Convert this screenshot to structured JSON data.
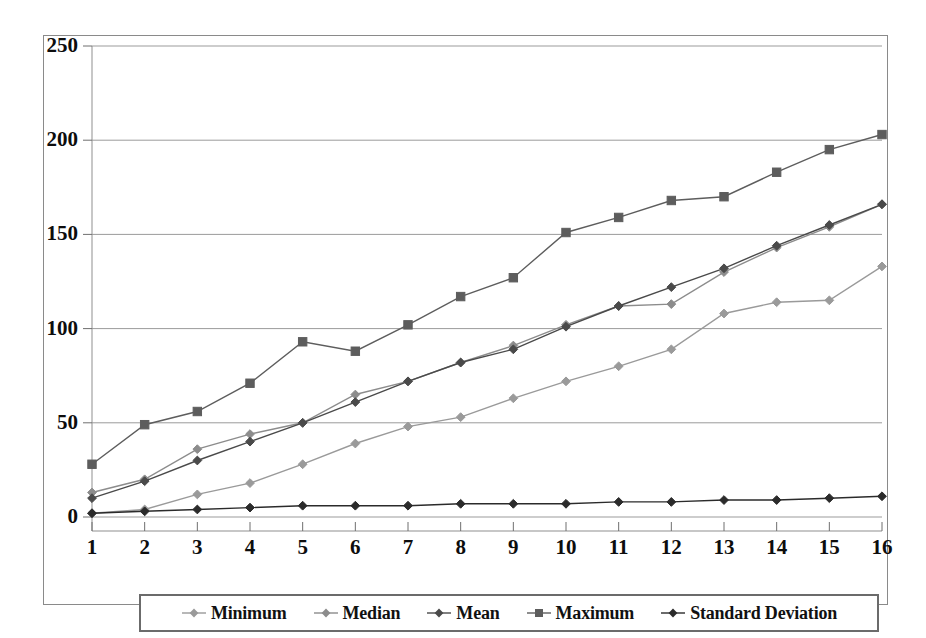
{
  "chart_data": {
    "type": "line",
    "title": "",
    "xlabel": "",
    "ylabel": "",
    "x": [
      1,
      2,
      3,
      4,
      5,
      6,
      7,
      8,
      9,
      10,
      11,
      12,
      13,
      14,
      15,
      16
    ],
    "xtick_labels": [
      "1",
      "2",
      "3",
      "4",
      "5",
      "6",
      "7",
      "8",
      "9",
      "10",
      "11",
      "12",
      "13",
      "14",
      "15",
      "16"
    ],
    "ytick_labels": [
      "0",
      "50",
      "100",
      "150",
      "200",
      "250"
    ],
    "yticks": [
      0,
      50,
      100,
      150,
      200,
      250
    ],
    "ylim": [
      0,
      250
    ],
    "xlim": [
      1,
      16
    ],
    "grid": "horizontal",
    "legend_position": "bottom",
    "series": [
      {
        "name": "Minimum",
        "color": "#9a9a9a",
        "marker": "diamond",
        "values": [
          2,
          4,
          12,
          18,
          28,
          39,
          48,
          53,
          63,
          72,
          80,
          89,
          108,
          114,
          115,
          133
        ]
      },
      {
        "name": "Median",
        "color": "#8c8c8c",
        "marker": "diamond",
        "values": [
          13,
          20,
          36,
          44,
          50,
          65,
          72,
          82,
          91,
          102,
          112,
          113,
          130,
          143,
          154,
          166
        ]
      },
      {
        "name": "Mean",
        "color": "#4a4a4a",
        "marker": "diamond",
        "values": [
          10,
          19,
          30,
          40,
          50,
          61,
          72,
          82,
          89,
          101,
          112,
          122,
          132,
          144,
          155,
          166
        ]
      },
      {
        "name": "Maximum",
        "color": "#5d5d5d",
        "marker": "square",
        "values": [
          28,
          49,
          56,
          71,
          93,
          88,
          102,
          117,
          127,
          151,
          159,
          168,
          170,
          183,
          195,
          203
        ]
      },
      {
        "name": "Standard Deviation",
        "color": "#2b2b2b",
        "marker": "diamond",
        "values": [
          2,
          3,
          4,
          5,
          6,
          6,
          6,
          7,
          7,
          7,
          8,
          8,
          9,
          9,
          10,
          11
        ]
      }
    ]
  },
  "legend": {
    "items": [
      {
        "label": "Minimum"
      },
      {
        "label": "Median"
      },
      {
        "label": "Mean"
      },
      {
        "label": "Maximum"
      },
      {
        "label": "Standard Deviation"
      }
    ]
  }
}
